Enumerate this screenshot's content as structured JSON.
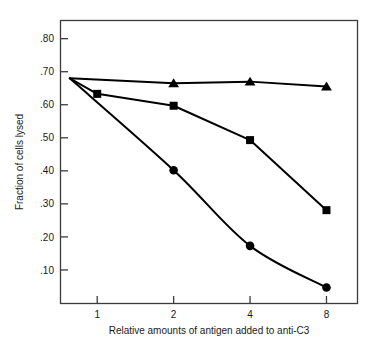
{
  "chart_data": {
    "type": "line",
    "title": "",
    "subtitle": "",
    "xlabel": "Relative amounts of antigen added to anti-C3",
    "ylabel": "Fraction of cells lysed",
    "x_scale": "log2",
    "x_ticks": [
      1,
      2,
      4,
      8
    ],
    "x_tick_labels": [
      "1",
      "2",
      "4",
      "8"
    ],
    "xlim": [
      0.72,
      10.6
    ],
    "y_ticks": [
      0.1,
      0.2,
      0.3,
      0.4,
      0.5,
      0.6,
      0.7,
      0.8
    ],
    "y_tick_labels": [
      ".10",
      ".20",
      ".30",
      ".40",
      ".50",
      ".60",
      ".70",
      ".80"
    ],
    "ylim": [
      0.0,
      0.855
    ],
    "grid": false,
    "legend": "none",
    "origin_point": {
      "x": 0.78,
      "y": 0.68
    },
    "series": [
      {
        "name": "triangle-series",
        "marker": "triangle",
        "color": "#000000",
        "x": [
          0.78,
          2,
          4,
          8
        ],
        "values": [
          0.68,
          0.665,
          0.67,
          0.655
        ]
      },
      {
        "name": "square-series",
        "marker": "square",
        "color": "#000000",
        "x": [
          0.78,
          1,
          2,
          4,
          8
        ],
        "values": [
          0.68,
          0.633,
          0.597,
          0.493,
          0.281
        ]
      },
      {
        "name": "circle-series",
        "marker": "circle",
        "color": "#000000",
        "x": [
          0.78,
          2,
          4,
          8
        ],
        "values": [
          0.68,
          0.402,
          0.173,
          0.047
        ]
      }
    ]
  },
  "axes": {
    "x_axis_title": "Relative amounts of antigen added to anti-C3",
    "y_axis_title": "Fraction of cells lysed"
  }
}
